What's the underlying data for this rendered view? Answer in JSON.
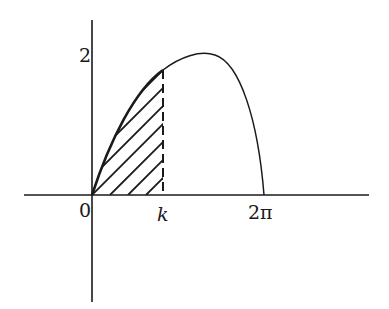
{
  "figure": {
    "type": "function-graph-with-shaded-area",
    "curve_description": "hump-shaped curve starting at origin, peaking slightly above y=2, returning to zero at x=2π",
    "shaded_region": "area under curve from 0 to k, diagonal hatching, dashed vertical boundary at k"
  },
  "labels": {
    "y_tick": "2",
    "origin": "0",
    "k": "k",
    "two_pi": "2π"
  },
  "colors": {
    "stroke": "#1a1a1a",
    "background": "#ffffff"
  }
}
